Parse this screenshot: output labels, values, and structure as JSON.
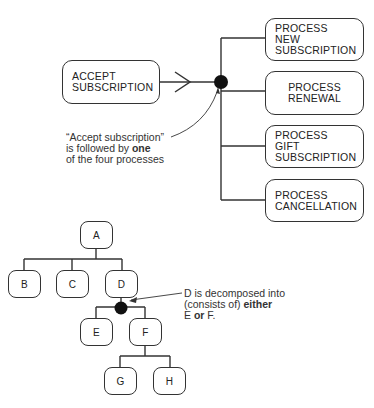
{
  "top_diagram": {
    "source": {
      "line1": "ACCEPT",
      "line2": "SUBSCRIPTION"
    },
    "targets": [
      {
        "line1": "PROCESS",
        "line2": "NEW",
        "line3": "SUBSCRIPTION"
      },
      {
        "line1": "PROCESS",
        "line2": "RENEWAL"
      },
      {
        "line1": "PROCESS",
        "line2": "GIFT",
        "line3": "SUBSCRIPTION"
      },
      {
        "line1": "PROCESS",
        "line2": "CANCELLATION"
      }
    ],
    "annotation": {
      "line1": "“Accept subscription”",
      "line2_pre": "is followed by ",
      "line2_bold": "one",
      "line3": "of the four processes"
    }
  },
  "bottom_diagram": {
    "nodes": {
      "a": "A",
      "b": "B",
      "c": "C",
      "d": "D",
      "e": "E",
      "f": "F",
      "g": "G",
      "h": "H"
    },
    "annotation": {
      "line1": "D is decomposed into",
      "line2_pre": "(consists of) ",
      "line2_bold": "either",
      "line3_pre": "E ",
      "line3_bold": "or",
      "line3_post": " F."
    }
  },
  "colors": {
    "stroke": "#333333",
    "text": "#222222",
    "background": "#ffffff"
  }
}
